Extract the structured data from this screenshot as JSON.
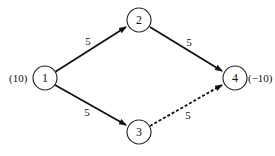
{
  "diagram": {
    "type": "network-flow",
    "nodes": [
      {
        "id": "1",
        "label": "1",
        "x": 45,
        "y": 78,
        "supply": "(10)"
      },
      {
        "id": "2",
        "label": "2",
        "x": 139,
        "y": 20
      },
      {
        "id": "3",
        "label": "3",
        "x": 139,
        "y": 132
      },
      {
        "id": "4",
        "label": "4",
        "x": 235,
        "y": 78,
        "supply": "(−10)"
      }
    ],
    "edges": [
      {
        "from": "1",
        "to": "2",
        "label": "5",
        "style": "solid"
      },
      {
        "from": "1",
        "to": "3",
        "label": "5",
        "style": "solid"
      },
      {
        "from": "2",
        "to": "4",
        "label": "5",
        "style": "solid"
      },
      {
        "from": "3",
        "to": "4",
        "label": "5",
        "style": "dashed"
      }
    ]
  }
}
